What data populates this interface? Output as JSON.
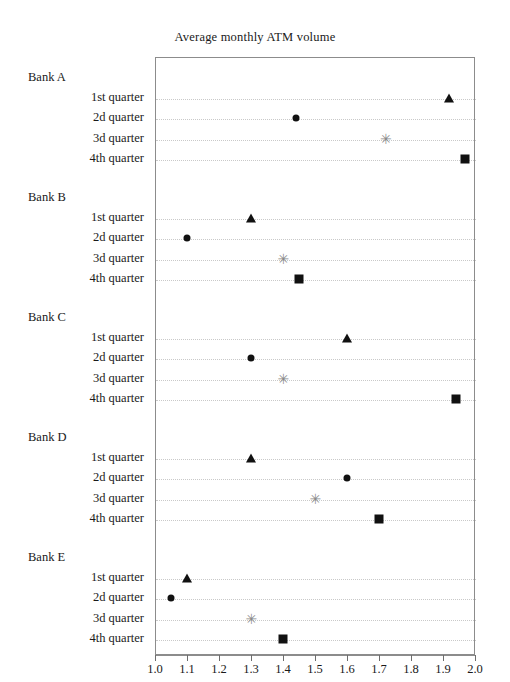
{
  "chart_data": {
    "type": "scatter",
    "title": "Average monthly ATM volume",
    "xlabel": "",
    "ylabel": "",
    "xlim": [
      1.0,
      2.0
    ],
    "xticks": [
      "1.0",
      "1.1",
      "1.2",
      "1.3",
      "1.4",
      "1.5",
      "1.6",
      "1.7",
      "1.8",
      "1.9",
      "2.0"
    ],
    "xtick_values": [
      1.0,
      1.1,
      1.2,
      1.3,
      1.4,
      1.5,
      1.6,
      1.7,
      1.8,
      1.9,
      2.0
    ],
    "grid": true,
    "legend": "none",
    "orientation": "horizontal-dotplot",
    "group_label_prefix": "Bank",
    "categories": [
      "1st quarter",
      "2d quarter",
      "3d quarter",
      "4th quarter"
    ],
    "marker_by_category": {
      "1st quarter": "triangle",
      "2d quarter": "circle",
      "3d quarter": "asterisk",
      "4th quarter": "square"
    },
    "groups": [
      {
        "name": "Bank A",
        "points": [
          {
            "label": "1st quarter",
            "value": 1.92,
            "marker": "triangle"
          },
          {
            "label": "2d quarter",
            "value": 1.44,
            "marker": "circle"
          },
          {
            "label": "3d quarter",
            "value": 1.72,
            "marker": "asterisk"
          },
          {
            "label": "4th quarter",
            "value": 1.97,
            "marker": "square"
          }
        ]
      },
      {
        "name": "Bank B",
        "points": [
          {
            "label": "1st quarter",
            "value": 1.3,
            "marker": "triangle"
          },
          {
            "label": "2d quarter",
            "value": 1.1,
            "marker": "circle"
          },
          {
            "label": "3d quarter",
            "value": 1.4,
            "marker": "asterisk"
          },
          {
            "label": "4th quarter",
            "value": 1.45,
            "marker": "square"
          }
        ]
      },
      {
        "name": "Bank C",
        "points": [
          {
            "label": "1st quarter",
            "value": 1.6,
            "marker": "triangle"
          },
          {
            "label": "2d quarter",
            "value": 1.3,
            "marker": "circle"
          },
          {
            "label": "3d quarter",
            "value": 1.4,
            "marker": "asterisk"
          },
          {
            "label": "4th quarter",
            "value": 1.94,
            "marker": "square"
          }
        ]
      },
      {
        "name": "Bank D",
        "points": [
          {
            "label": "1st quarter",
            "value": 1.3,
            "marker": "triangle"
          },
          {
            "label": "2d quarter",
            "value": 1.6,
            "marker": "circle"
          },
          {
            "label": "3d quarter",
            "value": 1.5,
            "marker": "asterisk"
          },
          {
            "label": "4th quarter",
            "value": 1.7,
            "marker": "square"
          }
        ]
      },
      {
        "name": "Bank E",
        "points": [
          {
            "label": "1st quarter",
            "value": 1.1,
            "marker": "triangle"
          },
          {
            "label": "2d quarter",
            "value": 1.05,
            "marker": "circle"
          },
          {
            "label": "3d quarter",
            "value": 1.3,
            "marker": "asterisk"
          },
          {
            "label": "4th quarter",
            "value": 1.4,
            "marker": "square"
          }
        ]
      }
    ],
    "asterisk_glyph": "✳",
    "colors": {
      "marker": "#111111",
      "asterisk": "#8a8a8a",
      "grid": "#c9c9c9",
      "frame": "#8c8c8c",
      "text": "#1a1a1a"
    }
  }
}
